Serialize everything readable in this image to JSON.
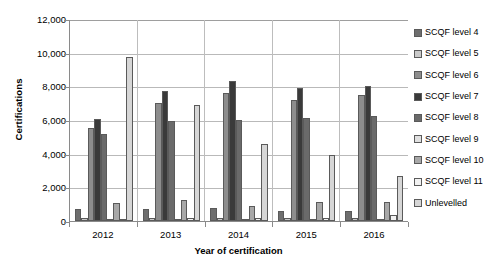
{
  "chart_data": {
    "type": "bar",
    "title": "",
    "xlabel": "Year of certification",
    "ylabel": "Certifications",
    "categories": [
      "2012",
      "2013",
      "2014",
      "2015",
      "2016"
    ],
    "ylim": [
      0,
      12000
    ],
    "ytick_labels": [
      "0",
      "2,000",
      "4,000",
      "6,000",
      "8,000",
      "10,000",
      "12,000"
    ],
    "ytick_values": [
      0,
      2000,
      4000,
      6000,
      8000,
      10000,
      12000
    ],
    "grid": true,
    "legend_position": "right",
    "series": [
      {
        "name": "SCQF level 4",
        "color": "#6e6e6e",
        "values": [
          700,
          700,
          800,
          600,
          600
        ]
      },
      {
        "name": "SCQF level 5",
        "color": "#c9c9c9",
        "values": [
          150,
          150,
          150,
          150,
          150
        ]
      },
      {
        "name": "SCQF level 6",
        "color": "#8d8d8d",
        "values": [
          5500,
          7000,
          7600,
          7200,
          7500
        ]
      },
      {
        "name": "SCQF level 7",
        "color": "#3a3a3a",
        "values": [
          6050,
          7700,
          8300,
          7900,
          8000
        ]
      },
      {
        "name": "SCQF level 8",
        "color": "#6a6a6a",
        "values": [
          5150,
          5950,
          6000,
          6100,
          6250
        ]
      },
      {
        "name": "SCQF level 9",
        "color": "#e0e0e0",
        "values": [
          60,
          60,
          60,
          60,
          60
        ]
      },
      {
        "name": "SCQF level 10",
        "color": "#a8a8a8",
        "values": [
          1050,
          1250,
          900,
          1100,
          1150
        ]
      },
      {
        "name": "SCQF level 11",
        "color": "#f2f2f2",
        "values": [
          100,
          150,
          200,
          180,
          350
        ]
      },
      {
        "name": "Unlevelled",
        "color": "#d6d6d6",
        "values": [
          9750,
          6900,
          4550,
          3950,
          2650
        ]
      }
    ]
  },
  "legend": {
    "items": [
      {
        "label": "SCQF level 4"
      },
      {
        "label": "SCQF level 5"
      },
      {
        "label": "SCQF level 6"
      },
      {
        "label": "SCQF level 7"
      },
      {
        "label": "SCQF level 8"
      },
      {
        "label": "SCQF level 9"
      },
      {
        "label": "SCQF level 10"
      },
      {
        "label": "SCQF level 11"
      },
      {
        "label": "Unlevelled"
      }
    ]
  }
}
